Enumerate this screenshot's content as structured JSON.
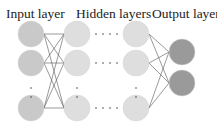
{
  "labels": {
    "input": "Input layer",
    "hidden": "Hidden layers",
    "output": "Output layer"
  },
  "colors": {
    "input_node": "#c9c9c9",
    "hidden_node": "#dedede",
    "output_node": "#9a9a9a",
    "edge": "#555555",
    "dot": "#444444"
  },
  "layers": {
    "input": {
      "x": 31,
      "nodes": [
        34,
        63,
        108
      ],
      "radius": 13
    },
    "hidden_first": {
      "x": 77,
      "nodes": [
        34,
        63,
        108
      ],
      "radius": 13
    },
    "hidden_last": {
      "x": 136,
      "nodes": [
        34,
        63,
        108
      ],
      "radius": 13
    },
    "output": {
      "x": 182,
      "nodes": [
        52,
        83
      ],
      "radius": 13
    }
  }
}
